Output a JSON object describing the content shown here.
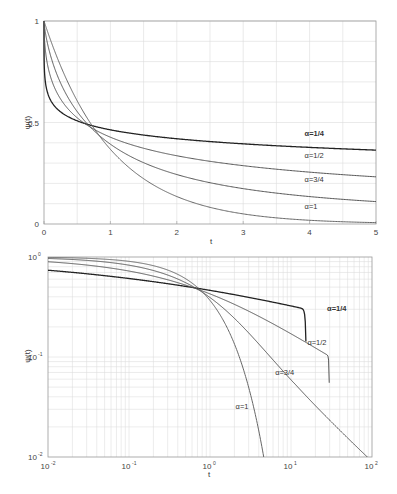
{
  "chart_data": [
    {
      "type": "line",
      "title": "",
      "xlabel": "t",
      "ylabel": "ψ(t)",
      "xlim": [
        0,
        5
      ],
      "ylim": [
        0,
        1
      ],
      "xscale": "linear",
      "yscale": "linear",
      "grid": true,
      "x_ticks": [
        "0",
        "1",
        "2",
        "3",
        "4",
        "5"
      ],
      "y_ticks": [
        "0",
        "0.5",
        "1"
      ],
      "series": [
        {
          "name": "α=1/4",
          "alpha": 0.25,
          "x": [
            0,
            0.5,
            0.7,
            1,
            2,
            3,
            4,
            5
          ],
          "values": [
            1.0,
            0.51,
            0.49,
            0.47,
            0.43,
            0.4,
            0.38,
            0.37
          ]
        },
        {
          "name": "α=1/2",
          "alpha": 0.5,
          "x": [
            0,
            0.5,
            0.7,
            1,
            2,
            3,
            4,
            5
          ],
          "values": [
            1.0,
            0.53,
            0.49,
            0.43,
            0.36,
            0.3,
            0.27,
            0.24
          ]
        },
        {
          "name": "α=3/4",
          "alpha": 0.75,
          "x": [
            0,
            0.5,
            0.7,
            1,
            2,
            3,
            4,
            5
          ],
          "values": [
            1.0,
            0.56,
            0.49,
            0.41,
            0.24,
            0.17,
            0.13,
            0.11
          ]
        },
        {
          "name": "α=1",
          "alpha": 1.0,
          "x": [
            0,
            0.5,
            0.7,
            1,
            2,
            3,
            4,
            5
          ],
          "values": [
            1.0,
            0.61,
            0.5,
            0.37,
            0.14,
            0.05,
            0.02,
            0.01
          ]
        }
      ],
      "annotations": [
        {
          "text": "α=1/4",
          "x": 4.0,
          "y": 0.45
        },
        {
          "text": "α=1/2",
          "x": 4.0,
          "y": 0.34
        },
        {
          "text": "α=3/4",
          "x": 4.0,
          "y": 0.22
        },
        {
          "text": "α=1",
          "x": 4.0,
          "y": 0.09
        }
      ]
    },
    {
      "type": "line",
      "title": "",
      "xlabel": "t",
      "ylabel": "ψ(t)",
      "xlim": [
        0.01,
        100
      ],
      "ylim": [
        0.01,
        1
      ],
      "xscale": "log",
      "yscale": "log",
      "grid": true,
      "x_ticks": [
        "10^-2",
        "10^-1",
        "10^0",
        "10^1",
        "10^2"
      ],
      "y_ticks": [
        "10^-2",
        "10^-1",
        "10^0"
      ],
      "series": [
        {
          "name": "α=1/4",
          "alpha": 0.25,
          "x": [
            0.01,
            0.1,
            0.7,
            10,
            100
          ],
          "values": [
            0.74,
            0.63,
            0.49,
            0.34,
            0.21
          ]
        },
        {
          "name": "α=1/2",
          "alpha": 0.5,
          "x": [
            0.01,
            0.1,
            0.7,
            10,
            100
          ],
          "values": [
            0.89,
            0.73,
            0.49,
            0.17,
            0.056
          ]
        },
        {
          "name": "α=3/4",
          "alpha": 0.75,
          "x": [
            0.01,
            0.1,
            0.7,
            10,
            100
          ],
          "values": [
            0.96,
            0.86,
            0.49,
            0.08,
            0.011
          ]
        },
        {
          "name": "α=1",
          "alpha": 1.0,
          "x": [
            0.01,
            0.1,
            0.7,
            3,
            4.6
          ],
          "values": [
            0.99,
            0.9,
            0.5,
            0.05,
            0.01
          ]
        }
      ],
      "annotations": [
        {
          "text": "α=1/4",
          "x": 35,
          "y": 0.31
        },
        {
          "text": "α=1/2",
          "x": 20,
          "y": 0.14
        },
        {
          "text": "α=3/4",
          "x": 8,
          "y": 0.07
        },
        {
          "text": "α=1",
          "x": 2.6,
          "y": 0.032
        }
      ]
    }
  ]
}
